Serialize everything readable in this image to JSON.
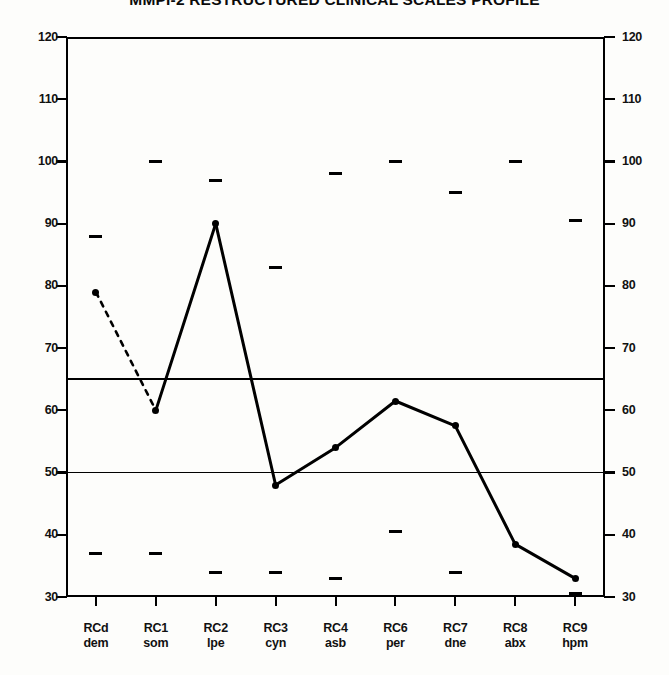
{
  "chart_data": {
    "type": "line",
    "title": "MMPI-2 RESTRUCTURED CLINICAL SCALES PROFILE",
    "xlabel": "",
    "ylabel": "",
    "ylim": [
      30,
      120
    ],
    "yticks": [
      120,
      110,
      100,
      90,
      80,
      70,
      60,
      50,
      40,
      30
    ],
    "grid": false,
    "dual_y_axis": true,
    "legend": "none",
    "reference_lines": [
      {
        "value": 65,
        "style": "solid-thick"
      },
      {
        "value": 50,
        "style": "solid-thin"
      }
    ],
    "categories": [
      "RCd",
      "RC1",
      "RC2",
      "RC3",
      "RC4",
      "RC6",
      "RC7",
      "RC8",
      "RC9"
    ],
    "category_sublabels": [
      "dem",
      "som",
      "lpe",
      "cyn",
      "asb",
      "per",
      "dne",
      "abx",
      "hpm"
    ],
    "series": [
      {
        "name": "T-score",
        "values": [
          79,
          60,
          90,
          48,
          54,
          61.5,
          57.5,
          38.5,
          33
        ]
      },
      {
        "name": "Upper confidence marker",
        "values": [
          88,
          100,
          97,
          83,
          98,
          100,
          95,
          100,
          90.5
        ]
      },
      {
        "name": "Lower confidence marker",
        "values": [
          37,
          37,
          34,
          34,
          33,
          40.5,
          34,
          null,
          30.5
        ]
      }
    ],
    "segment_styles": [
      "dashed",
      "solid",
      "solid",
      "solid",
      "solid",
      "solid",
      "solid",
      "solid"
    ],
    "annotations": []
  },
  "axis": {
    "tick_labels_left": [
      "120",
      "110",
      "100",
      "90",
      "80",
      "70",
      "60",
      "50",
      "40",
      "30"
    ],
    "tick_labels_right": [
      "120",
      "110",
      "100",
      "90",
      "80",
      "70",
      "60",
      "50",
      "40",
      "30"
    ]
  }
}
